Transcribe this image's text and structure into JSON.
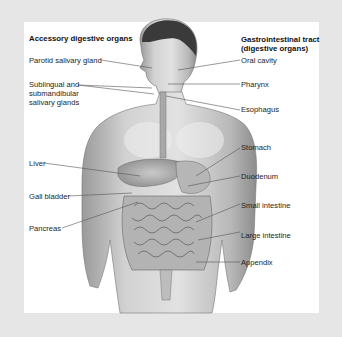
{
  "diagram": {
    "left_group": {
      "heading": "Accessory digestive organs",
      "labels": [
        "Parotid salivary gland",
        "Sublingual and",
        "submandibular",
        "salivary glands",
        "Liver",
        "Gall bladder",
        "Pancreas"
      ]
    },
    "right_group": {
      "heading_line1": "Gastrointestinal tract",
      "heading_line2": "(digestive organs)",
      "labels": [
        "Oral cavity",
        "Pharynx",
        "Esophagus",
        "Stomach",
        "Duodenum",
        "Small intestine",
        "Large intestine",
        "Appendix"
      ]
    },
    "colors": {
      "background": "#e6e6e6",
      "panel": "#ffffff",
      "text": "#1e1e1e",
      "leader_line": "#555555"
    }
  }
}
